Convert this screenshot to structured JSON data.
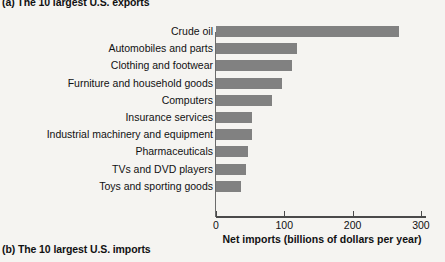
{
  "panel_a": {
    "title": "(a) The 10 largest U.S. exports"
  },
  "panel_b": {
    "title": "(b) The 10 largest U.S. imports"
  },
  "chart_data": {
    "type": "bar",
    "orientation": "horizontal",
    "title": "(a) The 10 largest U.S. exports",
    "xlabel": "Net imports (billions of dollars per year)",
    "ylabel": "",
    "xlim": [
      0,
      310
    ],
    "xticks": [
      0,
      100,
      200,
      300
    ],
    "xtick_labels": [
      "0",
      "100",
      "200",
      "300"
    ],
    "grid": false,
    "legend": false,
    "bar_color": "#818181",
    "categories": [
      "Crude oil",
      "Automobiles and parts",
      "Clothing and footwear",
      "Furniture and household goods",
      "Computers",
      "Insurance services",
      "Industrial machinery and equipment",
      "Pharmaceuticals",
      "TVs and DVD players",
      "Toys and sporting goods"
    ],
    "values": [
      268,
      119,
      112,
      96,
      82,
      53,
      53,
      47,
      44,
      37
    ]
  },
  "colors": {
    "background": "#f5f4f1",
    "bar": "#818181",
    "axis": "#4a4a4a",
    "text": "#111111"
  }
}
